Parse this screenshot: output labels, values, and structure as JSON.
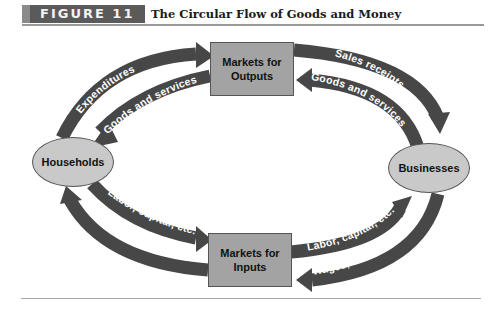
{
  "header": {
    "figure_label": "FIGURE 11",
    "title": "The Circular Flow of Goods and Money"
  },
  "nodes": {
    "markets_outputs": "Markets for Outputs",
    "markets_outputs_line1": "Markets for",
    "markets_outputs_line2": "Outputs",
    "markets_inputs_line1": "Markets for",
    "markets_inputs_line2": "Inputs",
    "households": "Households",
    "businesses": "Businesses"
  },
  "flows": {
    "expenditures": "Expenditures",
    "goods_services_to_households": "Goods and services",
    "sales_receipts": "Sales receipts",
    "goods_services_from_businesses": "Goods and services",
    "labor_capital_from_households": "Labor, capital, etc.",
    "incomes": "Incomes",
    "labor_capital_to_businesses": "Labor, capital, etc.",
    "wages_interest": "Wages, interest, etc."
  },
  "colors": {
    "arrow": "#474747",
    "box_fill": "#a3a3a3",
    "ellipse_fill": "#c9c9c9",
    "header_block": "#5a5a5a"
  }
}
